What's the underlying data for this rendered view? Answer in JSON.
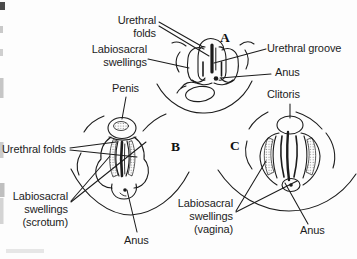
{
  "figure": {
    "title_context": "Development of external genitalia diagram",
    "panels": [
      {
        "id": "indifferent-stage",
        "letter": "A"
      },
      {
        "id": "male-stage",
        "letter": "B"
      },
      {
        "id": "female-stage",
        "letter": "C"
      }
    ],
    "labels": {
      "urethral_folds_a": "Urethral\nfolds",
      "labiosacral_swellings_a": "Labiosacral\nswellings",
      "urethral_groove": "Urethral groove",
      "anus_a": "Anus",
      "penis": "Penis",
      "clitoris": "Clitoris",
      "urethral_folds_b": "Urethral folds",
      "labiosacral_swellings_b": "Labiosacral\nswellings\n(scrotum)",
      "anus_b": "Anus",
      "labiosacral_swellings_c": "Labiosacral\nswellings\n(vagina)",
      "anus_c": "Anus"
    },
    "colors": {
      "ink": "#1c1c1c",
      "paper": "#fdfdfd"
    }
  }
}
